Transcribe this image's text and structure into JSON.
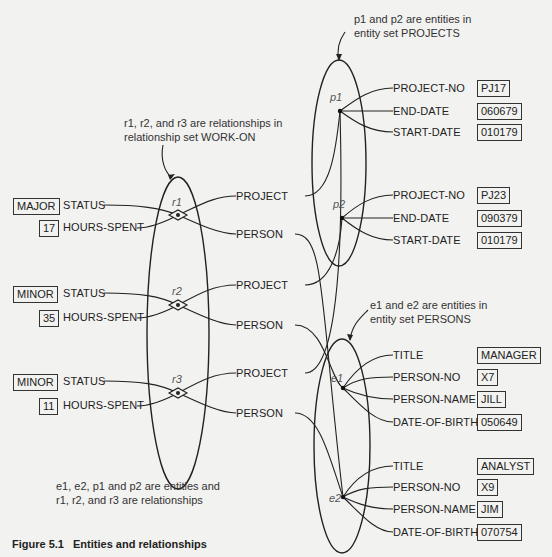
{
  "figure": {
    "caption_label": "Figure 5.1",
    "caption_title": "Entities and relationships"
  },
  "notes": {
    "relationships_note_line1": "r1, r2, and r3 are relationships in",
    "relationships_note_line2": "relationship set WORK-ON",
    "projects_note_line1": "p1 and p2 are entities in",
    "projects_note_line2": "entity set PROJECTS",
    "persons_note_line1": "e1 and e2 are entities in",
    "persons_note_line2": "entity set PERSONS",
    "summary_line1": "e1, e2, p1 and p2 are entities and",
    "summary_line2": "r1, r2, and r3 are relationships"
  },
  "relationship_set": {
    "name": "WORK-ON",
    "relationships": [
      {
        "id": "r1",
        "status_label": "STATUS",
        "status_value": "MAJOR",
        "hours_label": "HOURS-SPENT",
        "hours_value": "17",
        "role_project": "PROJECT",
        "role_person": "PERSON"
      },
      {
        "id": "r2",
        "status_label": "STATUS",
        "status_value": "MINOR",
        "hours_label": "HOURS-SPENT",
        "hours_value": "35",
        "role_project": "PROJECT",
        "role_person": "PERSON"
      },
      {
        "id": "r3",
        "status_label": "STATUS",
        "status_value": "MINOR",
        "hours_label": "HOURS-SPENT",
        "hours_value": "11",
        "role_project": "PROJECT",
        "role_person": "PERSON"
      }
    ]
  },
  "projects": {
    "name": "PROJECTS",
    "entities": [
      {
        "id": "p1",
        "attrs": [
          {
            "name": "PROJECT-NO",
            "value": "PJ17"
          },
          {
            "name": "END-DATE",
            "value": "060679"
          },
          {
            "name": "START-DATE",
            "value": "010179"
          }
        ]
      },
      {
        "id": "p2",
        "attrs": [
          {
            "name": "PROJECT-NO",
            "value": "PJ23"
          },
          {
            "name": "END-DATE",
            "value": "090379"
          },
          {
            "name": "START-DATE",
            "value": "010179"
          }
        ]
      }
    ]
  },
  "persons": {
    "name": "PERSONS",
    "entities": [
      {
        "id": "e1",
        "attrs": [
          {
            "name": "TITLE",
            "value": "MANAGER"
          },
          {
            "name": "PERSON-NO",
            "value": "X7"
          },
          {
            "name": "PERSON-NAME",
            "value": "JILL"
          },
          {
            "name": "DATE-OF-BIRTH",
            "value": "050649"
          }
        ]
      },
      {
        "id": "e2",
        "attrs": [
          {
            "name": "TITLE",
            "value": "ANALYST"
          },
          {
            "name": "PERSON-NO",
            "value": "X9"
          },
          {
            "name": "PERSON-NAME",
            "value": "JIM"
          },
          {
            "name": "DATE-OF-BIRTH",
            "value": "070754"
          }
        ]
      }
    ]
  },
  "colors": {
    "ink": "#222222",
    "paper": "#f2f2f0"
  }
}
